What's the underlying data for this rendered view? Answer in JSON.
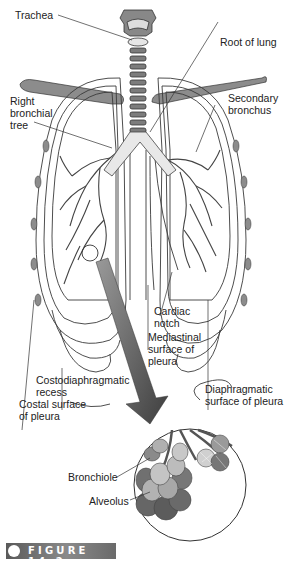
{
  "diagram": {
    "labels": {
      "trachea": "Trachea",
      "root_of_lung": "Root of lung",
      "right_bronchial_tree": [
        "Right",
        "bronchial",
        "tree"
      ],
      "secondary_bronchus": [
        "Secondary",
        "bronchus"
      ],
      "cardiac_notch": [
        "Cardiac",
        "notch"
      ],
      "mediastinal_surface": [
        "Mediastinal",
        "surface of",
        "pleura"
      ],
      "costodiaphragmatic_recess": [
        "Costodiaphragmatic",
        "recess"
      ],
      "costal_surface": [
        "Costal surface",
        "of pleura"
      ],
      "diaphragmatic_surface": [
        "Diaphragmatic",
        "surface of pleura"
      ],
      "bronchiole": "Bronchiole",
      "alveolus": "Alveolus"
    },
    "colors": {
      "line": "#3a3a3a",
      "rib": "#8c8c8c",
      "cartilage": "#7a7a7a",
      "arrow": "#555555",
      "alveoli_light": "#b8b8b8",
      "alveoli_dark": "#6e6e6e"
    }
  },
  "figure": {
    "label": "FIGURE 14-2"
  }
}
